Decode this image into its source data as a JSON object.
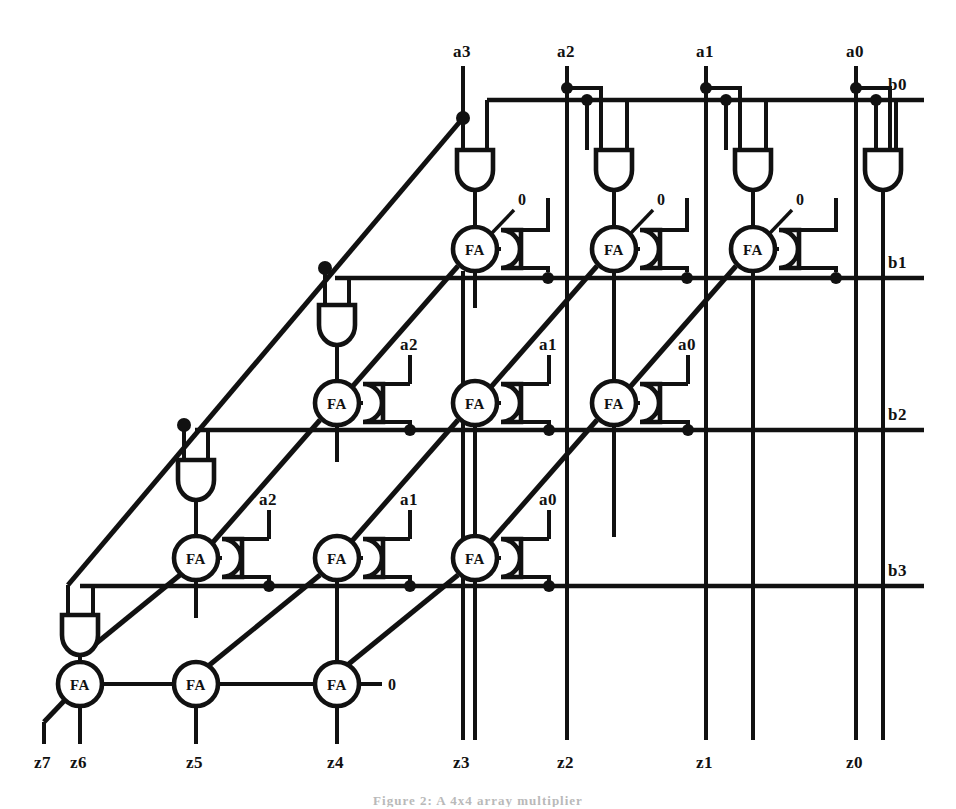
{
  "figure": {
    "caption": "Figure 2: A 4x4 array multiplier",
    "background_color": "#ffffff",
    "ink_color": "#111111"
  },
  "labels": {
    "top_inputs": [
      {
        "name": "a3",
        "x": 463,
        "y": 57
      },
      {
        "name": "a2",
        "x": 567,
        "y": 57
      },
      {
        "name": "a1",
        "x": 706,
        "y": 57
      },
      {
        "name": "a0",
        "x": 856,
        "y": 57
      }
    ],
    "right_inputs": [
      {
        "name": "b0",
        "x": 897,
        "y": 94
      },
      {
        "name": "b1",
        "x": 897,
        "y": 272
      },
      {
        "name": "b2",
        "x": 897,
        "y": 424
      },
      {
        "name": "b3",
        "x": 897,
        "y": 580
      }
    ],
    "row_and_inputs": [
      {
        "row": 2,
        "names": [
          "a2",
          "a1",
          "a0"
        ]
      },
      {
        "row": 3,
        "names": [
          "a2",
          "a1",
          "a0"
        ]
      },
      {
        "row": 4,
        "names": [
          "a2",
          "a1",
          "a0"
        ]
      }
    ],
    "outputs": [
      {
        "name": "z7",
        "x": 43,
        "y": 762
      },
      {
        "name": "z6",
        "x": 80,
        "y": 762
      },
      {
        "name": "z5",
        "x": 184,
        "y": 762
      },
      {
        "name": "z4",
        "x": 330,
        "y": 762
      },
      {
        "name": "z3",
        "x": 463,
        "y": 762
      },
      {
        "name": "z2",
        "x": 567,
        "y": 762
      },
      {
        "name": "z1",
        "x": 706,
        "y": 762
      },
      {
        "name": "z0",
        "x": 856,
        "y": 762
      }
    ],
    "constant_zeros": [
      {
        "value": "0",
        "x": 522,
        "y": 200
      },
      {
        "value": "0",
        "x": 660,
        "y": 200
      },
      {
        "value": "0",
        "x": 800,
        "y": 200
      },
      {
        "value": "0",
        "x": 390,
        "y": 682
      }
    ],
    "fa_text": "FA"
  },
  "counts": {
    "full_adders": 12,
    "and_gates": 16,
    "rows": 4,
    "columns": 4,
    "operand_bits": 4,
    "product_bits": 8
  },
  "legend": {
    "fa_meaning": "FA = full adder",
    "and_meaning": "AND gate produces partial product a_i AND b_j"
  }
}
